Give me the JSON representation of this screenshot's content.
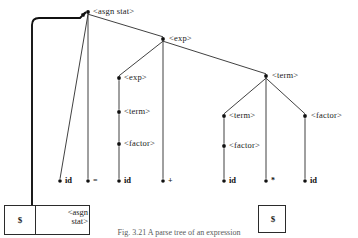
{
  "figure": {
    "caption": "Fig. 3.21   A parse tree of an expression",
    "type": "parse-tree-diagram"
  },
  "colors": {
    "line": "#2b2b2b",
    "node_dot": "#111111",
    "text": "#1a1a1a",
    "pointer": "#111111",
    "background": "#ffffff"
  },
  "tree": {
    "nodes": [
      {
        "id": "root",
        "label": "<asgn stat>",
        "x": 88,
        "y": 12,
        "kind": "nonterminal",
        "label_dx": 5,
        "label_dy": -5
      },
      {
        "id": "exp1",
        "label": "<exp>",
        "x": 163,
        "y": 39,
        "kind": "nonterminal",
        "label_dx": 6,
        "label_dy": -5
      },
      {
        "id": "exp2",
        "label": "<exp>",
        "x": 119,
        "y": 78,
        "kind": "nonterminal",
        "label_dx": 5,
        "label_dy": -5
      },
      {
        "id": "term1",
        "label": "<term>",
        "x": 119,
        "y": 112,
        "kind": "nonterminal",
        "label_dx": 5,
        "label_dy": -5
      },
      {
        "id": "factor1",
        "label": "<factor>",
        "x": 119,
        "y": 144,
        "kind": "nonterminal",
        "label_dx": 5,
        "label_dy": -5
      },
      {
        "id": "termR",
        "label": "<term>",
        "x": 266,
        "y": 76,
        "kind": "nonterminal",
        "label_dx": 6,
        "label_dy": -5
      },
      {
        "id": "term2",
        "label": "<term>",
        "x": 224,
        "y": 116,
        "kind": "nonterminal",
        "label_dx": 5,
        "label_dy": -5
      },
      {
        "id": "factor2",
        "label": "<factor>",
        "x": 224,
        "y": 146,
        "kind": "nonterminal",
        "label_dx": 5,
        "label_dy": -5
      },
      {
        "id": "factor3",
        "label": "<factor>",
        "x": 305,
        "y": 116,
        "kind": "nonterminal",
        "label_dx": 6,
        "label_dy": -5
      },
      {
        "id": "id1",
        "label": "id",
        "x": 60,
        "y": 181,
        "kind": "terminal",
        "label_dx": 5,
        "label_dy": -5
      },
      {
        "id": "eq",
        "label": "=",
        "x": 88,
        "y": 181,
        "kind": "terminal",
        "label_dx": 5,
        "label_dy": -5
      },
      {
        "id": "id2",
        "label": "id",
        "x": 119,
        "y": 181,
        "kind": "terminal",
        "label_dx": 5,
        "label_dy": -5
      },
      {
        "id": "plus",
        "label": "+",
        "x": 163,
        "y": 181,
        "kind": "terminal",
        "label_dx": 5,
        "label_dy": -5
      },
      {
        "id": "id3",
        "label": "id",
        "x": 224,
        "y": 181,
        "kind": "terminal",
        "label_dx": 5,
        "label_dy": -5
      },
      {
        "id": "star",
        "label": "*",
        "x": 266,
        "y": 181,
        "kind": "terminal",
        "label_dx": 5,
        "label_dy": -5
      },
      {
        "id": "id4",
        "label": "id",
        "x": 305,
        "y": 181,
        "kind": "terminal",
        "label_dx": 5,
        "label_dy": -5
      }
    ],
    "edges": [
      {
        "from": "root",
        "to": "id1"
      },
      {
        "from": "root",
        "to": "eq"
      },
      {
        "from": "root",
        "to": "exp1"
      },
      {
        "from": "exp1",
        "to": "exp2"
      },
      {
        "from": "exp1",
        "to": "plus"
      },
      {
        "from": "exp1",
        "to": "termR"
      },
      {
        "from": "exp2",
        "to": "term1"
      },
      {
        "from": "term1",
        "to": "factor1"
      },
      {
        "from": "factor1",
        "to": "id2"
      },
      {
        "from": "termR",
        "to": "term2"
      },
      {
        "from": "termR",
        "to": "star"
      },
      {
        "from": "termR",
        "to": "factor3"
      },
      {
        "from": "term2",
        "to": "factor2"
      },
      {
        "from": "factor2",
        "to": "id3"
      },
      {
        "from": "factor3",
        "to": "id4"
      }
    ]
  },
  "stacks": {
    "left": {
      "name": "parse-stack-left",
      "x": 4,
      "y": 205,
      "width": 86,
      "height": 30,
      "cells": [
        {
          "label": "$",
          "width": 30,
          "multiline": false
        },
        {
          "label": "<asgn\nstat>",
          "width": 56,
          "multiline": true
        }
      ],
      "pointer": {
        "x": 37,
        "y": 221
      }
    },
    "right": {
      "name": "parse-stack-right",
      "x": 258,
      "y": 205,
      "width": 28,
      "height": 28,
      "cells": [
        {
          "label": "$",
          "width": 28,
          "multiline": false
        }
      ]
    }
  },
  "pointer_arrow": {
    "name": "stack-to-root-pointer",
    "description": "thick curved arrow from stack cell up to root node",
    "from_x": 32,
    "from_y": 221,
    "corner_x": 32,
    "corner_y": 18,
    "to_x": 86,
    "to_y": 12
  }
}
